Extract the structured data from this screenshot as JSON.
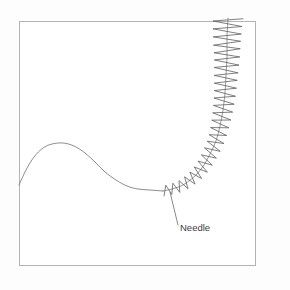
{
  "figure": {
    "background_color": "#fdfdfd",
    "panel_color": "#ffffff",
    "frame": {
      "color": "#b3b3b3",
      "x": 19,
      "y": 21,
      "width": 236,
      "height": 244
    },
    "annotations": [
      {
        "name": "needle-label",
        "text": "Needle",
        "x": 180,
        "y": 231,
        "color": "#3c3c40",
        "font_size": 9.5,
        "leader": {
          "from_x": 170,
          "from_y": 192,
          "to_x": 178,
          "to_y": 225,
          "color": "#6a6a6f"
        }
      }
    ]
  },
  "chart_data": {
    "type": "line",
    "xlabel": "",
    "ylabel": "",
    "grid": false,
    "legend": false,
    "xlim": [
      19,
      255
    ],
    "ylim": [
      265,
      18
    ],
    "annotations": [
      "Needle"
    ],
    "series": [
      {
        "name": "smooth-trace",
        "description": "smooth hump curve descending to a flat plateau",
        "color": "#6e6e73",
        "x": [
          19,
          26,
          34,
          43,
          52,
          63,
          74,
          85,
          95,
          105,
          116,
          127,
          138,
          150,
          163
        ],
        "y": [
          185,
          170,
          157,
          148,
          144,
          143,
          146,
          153,
          162,
          172,
          180,
          186,
          189,
          190,
          191
        ]
      },
      {
        "name": "coil-axis",
        "description": "centerline of the coiled needle, curving from horizontal to vertical",
        "color": "#6e6e73",
        "x": [
          163,
          172,
          181,
          189,
          197,
          204,
          210,
          216,
          220,
          223,
          225,
          226,
          227,
          227,
          228
        ],
        "y": [
          191,
          189,
          186,
          181,
          174,
          165,
          154,
          141,
          126,
          110,
          93,
          75,
          57,
          38,
          18
        ]
      },
      {
        "name": "coil-helix",
        "description": "zigzag helix wound about the coil axis; amplitude grows from 5px at the lower-left start to 15px at the vertical top",
        "color": "#5e5e63",
        "turns": 26,
        "amplitude_start": 5,
        "amplitude_end": 15
      }
    ]
  }
}
